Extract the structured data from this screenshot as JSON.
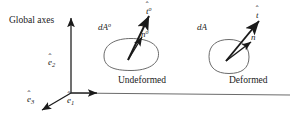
{
  "figure": {
    "title_note": "Global axes",
    "background_color": "#ffffff",
    "line_color": "#1a1a1a",
    "blob_stroke": "#555555"
  },
  "axes": {
    "label": "Global axes",
    "basis_vectors": [
      {
        "name": "e-hat-2",
        "symbol": "e",
        "subscript": "2",
        "accent": "hat",
        "direction": "up"
      },
      {
        "name": "e-hat-3",
        "symbol": "e",
        "subscript": "3",
        "accent": "hat",
        "direction": "down-left"
      },
      {
        "name": "e-hat-1",
        "symbol": "e",
        "subscript": "1",
        "accent": "hat",
        "direction": "right"
      }
    ]
  },
  "undeformed": {
    "caption": "Undeformed",
    "area_symbol": "dA",
    "area_superscript": "o",
    "traction_symbol": "t",
    "traction_superscript": "o",
    "normal_symbol": "n",
    "normal_superscript": "o"
  },
  "deformed": {
    "caption": "Deformed",
    "area_symbol": "dA",
    "area_superscript": "",
    "traction_symbol": "t",
    "traction_superscript": "",
    "normal_symbol": "n",
    "normal_superscript": ""
  },
  "glyphs": {
    "hat": "ˆ",
    "vector_accent": "ˆ",
    "degree_sup": "o"
  }
}
